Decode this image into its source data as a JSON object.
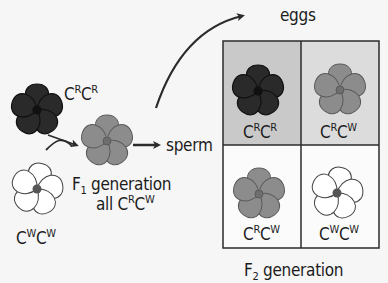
{
  "parents": {
    "red": {
      "allele1": "C",
      "sup1": "R",
      "allele2": "C",
      "sup2": "R",
      "color": "#2a2a2a"
    },
    "white": {
      "allele1": "C",
      "sup1": "W",
      "allele2": "C",
      "sup2": "W",
      "color": "#ffffff"
    }
  },
  "f1": {
    "label_prefix": "F",
    "label_sub": "1",
    "label_suffix": " generation",
    "all_prefix": "all ",
    "allele1": "C",
    "sup1": "R",
    "allele2": "C",
    "sup2": "W",
    "color": "#8c8c8c"
  },
  "labels": {
    "sperm": "sperm",
    "eggs": "eggs",
    "f2_prefix": "F",
    "f2_sub": "2",
    "f2_suffix": " generation"
  },
  "punnett": {
    "cells": [
      {
        "pos": "top-left",
        "allele1": "C",
        "sup1": "R",
        "allele2": "C",
        "sup2": "R",
        "flower_color": "#2a2a2a",
        "bg": "#c9c9c9"
      },
      {
        "pos": "top-right",
        "allele1": "C",
        "sup1": "R",
        "allele2": "C",
        "sup2": "W",
        "flower_color": "#8c8c8c",
        "bg": "#dcdcdc"
      },
      {
        "pos": "bottom-left",
        "allele1": "C",
        "sup1": "R",
        "allele2": "C",
        "sup2": "W",
        "flower_color": "#8c8c8c",
        "bg": "#fbfbfb"
      },
      {
        "pos": "bottom-right",
        "allele1": "C",
        "sup1": "W",
        "allele2": "C",
        "sup2": "W",
        "flower_color": "#ffffff",
        "bg": "#fbfbfb"
      }
    ]
  },
  "colors": {
    "line": "#2b2b2b",
    "background": "#f6f6f6"
  }
}
